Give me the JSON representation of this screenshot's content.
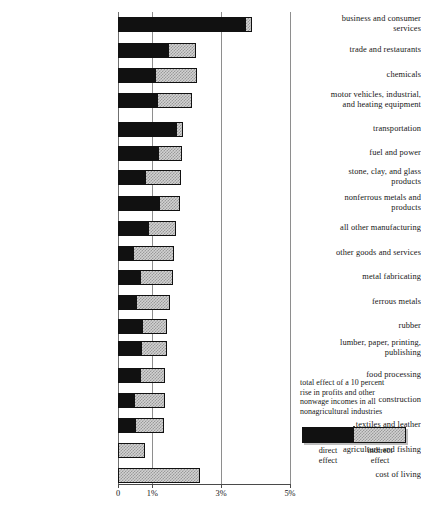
{
  "chart_data": {
    "type": "bar",
    "orientation": "horizontal",
    "stacked": true,
    "title": "",
    "xlabel": "",
    "ylabel": "",
    "xlim": [
      0,
      5
    ],
    "grid": true,
    "gridlines": [
      0,
      1,
      3,
      5
    ],
    "tick_labels": [
      "0",
      "1%",
      "3%",
      "5%"
    ],
    "tick_values": [
      0,
      1,
      3,
      5
    ],
    "legend": {
      "position": "bottom-right",
      "caption": "total effect of a 10 percent rise in profits and other nonwage incomes in all nonagricultural industries",
      "caption_lines": [
        "total effect of a 10 percent",
        "rise in profits and other",
        "nonwage incomes in all",
        "nonagricultural industries"
      ],
      "entries": [
        {
          "name": "direct effect",
          "line1": "direct",
          "line2": "effect",
          "color": "#111111",
          "pattern": "solid"
        },
        {
          "name": "indirect effect",
          "line1": "indirect",
          "line2": "effect",
          "color": "#d2d2d2",
          "pattern": "checkered"
        }
      ]
    },
    "series": [
      {
        "name": "direct effect",
        "values": [
          3.7,
          1.45,
          1.08,
          1.14,
          1.69,
          1.16,
          0.79,
          1.19,
          0.87,
          0.44,
          0.64,
          0.52,
          0.7,
          0.67,
          0.64,
          0.47,
          0.5,
          0.0,
          0.0
        ]
      },
      {
        "name": "indirect effect",
        "values": [
          0.2,
          0.82,
          1.22,
          1.01,
          0.2,
          0.7,
          1.05,
          0.61,
          0.82,
          1.19,
          0.96,
          0.99,
          0.72,
          0.74,
          0.73,
          0.89,
          0.84,
          0.79,
          2.39
        ]
      }
    ],
    "categories": [
      "business and consumer services",
      "trade and restaurants",
      "chemicals",
      "motor vehicles, industrial, and heating equipment",
      "transportation",
      "fuel and power",
      "stone, clay, and glass products",
      "nonferrous metals and products",
      "all other manufacturing",
      "other goods and services",
      "metal fabricating",
      "ferrous metals",
      "rubber",
      "lumber, paper, printing, publishing",
      "food processing",
      "construction",
      "textiles and leather",
      "agriculture and fishing",
      "cost of living"
    ],
    "totals": [
      3.9,
      2.27,
      2.3,
      2.15,
      1.89,
      1.86,
      1.84,
      1.8,
      1.69,
      1.63,
      1.6,
      1.51,
      1.42,
      1.41,
      1.37,
      1.36,
      1.34,
      0.79,
      2.39
    ],
    "rows": [
      {
        "label_line1": "business and consumer",
        "label_line2": "services",
        "direct": 3.7,
        "indirect": 0.2,
        "y": 17
      },
      {
        "label_line1": "trade and restaurants",
        "label_line2": "",
        "direct": 1.45,
        "indirect": 0.82,
        "y": 43
      },
      {
        "label_line1": "chemicals",
        "label_line2": "",
        "direct": 1.08,
        "indirect": 1.22,
        "y": 68
      },
      {
        "label_line1": "motor vehicles, industrial,",
        "label_line2": "and heating equipment",
        "direct": 1.14,
        "indirect": 1.01,
        "y": 93
      },
      {
        "label_line1": "transportation",
        "label_line2": "",
        "direct": 1.69,
        "indirect": 0.2,
        "y": 122
      },
      {
        "label_line1": "fuel and power",
        "label_line2": "",
        "direct": 1.16,
        "indirect": 0.7,
        "y": 146
      },
      {
        "label_line1": "stone, clay, and glass",
        "label_line2": "products",
        "direct": 0.79,
        "indirect": 1.05,
        "y": 170
      },
      {
        "label_line1": "nonferrous metals and",
        "label_line2": "products",
        "direct": 1.19,
        "indirect": 0.61,
        "y": 196
      },
      {
        "label_line1": "all other manufacturing",
        "label_line2": "",
        "direct": 0.87,
        "indirect": 0.82,
        "y": 221
      },
      {
        "label_line1": "other goods and services",
        "label_line2": "",
        "direct": 0.44,
        "indirect": 1.19,
        "y": 246
      },
      {
        "label_line1": "metal fabricating",
        "label_line2": "",
        "direct": 0.64,
        "indirect": 0.96,
        "y": 270
      },
      {
        "label_line1": "ferrous metals",
        "label_line2": "",
        "direct": 0.52,
        "indirect": 0.99,
        "y": 295
      },
      {
        "label_line1": "rubber",
        "label_line2": "",
        "direct": 0.7,
        "indirect": 0.72,
        "y": 319
      },
      {
        "label_line1": "lumber, paper, printing,",
        "label_line2": "publishing",
        "direct": 0.67,
        "indirect": 0.74,
        "y": 341
      },
      {
        "label_line1": "food processing",
        "label_line2": "",
        "direct": 0.64,
        "indirect": 0.73,
        "y": 368
      },
      {
        "label_line1": "construction",
        "label_line2": "",
        "direct": 0.47,
        "indirect": 0.89,
        "y": 393
      },
      {
        "label_line1": "textiles and leather",
        "label_line2": "",
        "direct": 0.5,
        "indirect": 0.84,
        "y": 418
      },
      {
        "label_line1": "agriculture and fishing",
        "label_line2": "",
        "direct": 0.0,
        "indirect": 0.79,
        "y": 443
      },
      {
        "label_line1": "cost of living",
        "label_line2": "",
        "direct": 0.0,
        "indirect": 2.39,
        "y": 468
      }
    ]
  }
}
